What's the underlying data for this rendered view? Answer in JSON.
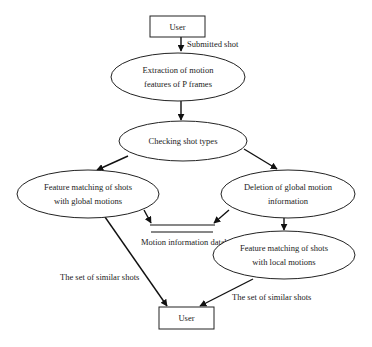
{
  "diagram": {
    "type": "flowchart",
    "nodes": {
      "user_top": {
        "label": "User",
        "shape": "rectangle"
      },
      "extraction": {
        "label_lines": [
          "Extraction of motion",
          "features of P frames"
        ],
        "shape": "ellipse"
      },
      "checking": {
        "label": "Checking shot types",
        "shape": "ellipse"
      },
      "global_match": {
        "label_lines": [
          "Feature matching of shots",
          "with global motions"
        ],
        "shape": "ellipse"
      },
      "deletion": {
        "label_lines": [
          "Deletion of global motion",
          "information"
        ],
        "shape": "ellipse"
      },
      "database": {
        "label": "Motion information databa",
        "shape": "datastore"
      },
      "local_match": {
        "label_lines": [
          "Feature matching of shots",
          "with local motions"
        ],
        "shape": "ellipse"
      },
      "user_bottom": {
        "label": "User",
        "shape": "rectangle"
      }
    },
    "edges": [
      {
        "from": "user_top",
        "to": "extraction",
        "label": "Submitted shot"
      },
      {
        "from": "extraction",
        "to": "checking",
        "label": ""
      },
      {
        "from": "checking",
        "to": "global_match",
        "label": ""
      },
      {
        "from": "checking",
        "to": "deletion",
        "label": ""
      },
      {
        "from": "global_match",
        "to": "database",
        "label": ""
      },
      {
        "from": "deletion",
        "to": "database",
        "label": ""
      },
      {
        "from": "deletion",
        "to": "local_match",
        "label": ""
      },
      {
        "from": "global_match",
        "to": "user_bottom",
        "label": "The set of similar shots"
      },
      {
        "from": "local_match",
        "to": "user_bottom",
        "label": "The set of similar shots"
      }
    ],
    "colors": {
      "stroke": "#222222",
      "fill": "#ffffff",
      "text": "#222222"
    }
  }
}
